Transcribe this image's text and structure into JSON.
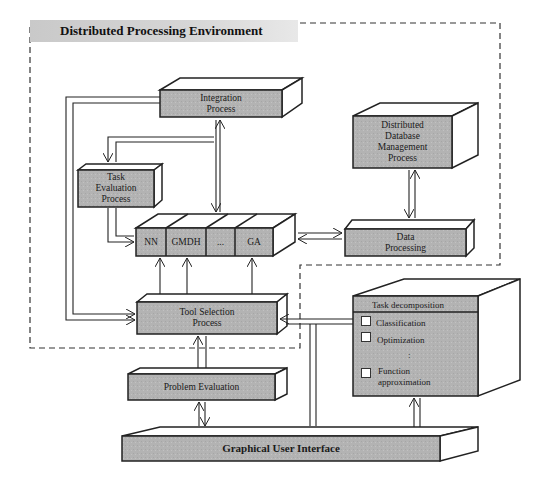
{
  "diagram": {
    "title": "Distributed Processing Environment",
    "nodes": {
      "integration": {
        "label_line1": "Integration",
        "label_line2": "Process"
      },
      "task_evaluation": {
        "label_line1": "Task",
        "label_line2": "Evaluation",
        "label_line3": "Process"
      },
      "ddbms": {
        "label_line1": "Distributed",
        "label_line2": "Database",
        "label_line3": "Management",
        "label_line4": "Process"
      },
      "tools": {
        "cells": [
          "NN",
          "GMDH",
          "...",
          "GA"
        ]
      },
      "data_processing": {
        "label_line1": "Data",
        "label_line2": "Processing"
      },
      "tool_selection": {
        "label_line1": "Tool Selection",
        "label_line2": "Process"
      },
      "task_decomposition": {
        "header": "Task decomposition",
        "items": [
          "Classification",
          "Optimization",
          "Function",
          "approximation"
        ],
        "ellipsis": ":"
      },
      "problem_evaluation": {
        "label": "Problem Evaluation"
      },
      "gui": {
        "label": "Graphical User Interface"
      }
    },
    "colors": {
      "box_fill": "#b4b4b4",
      "box_top": "#ffffff",
      "stroke": "#222222",
      "title_band": "#cfcfcf"
    }
  }
}
